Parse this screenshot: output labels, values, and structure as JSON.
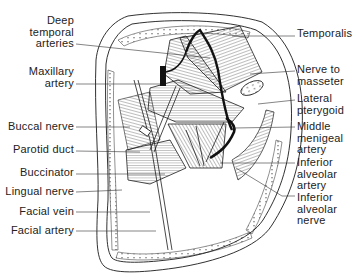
{
  "figure": {
    "colors": {
      "ink": "#1a1a1a",
      "background": "#ffffff"
    }
  },
  "labels": {
    "left": [
      {
        "id": "deep-temporal-arteries",
        "lines": [
          "Deep",
          "temporal",
          "arteries"
        ]
      },
      {
        "id": "maxillary-artery",
        "lines": [
          "Maxillary",
          "artery"
        ]
      },
      {
        "id": "buccal-nerve",
        "lines": [
          "Buccal nerve"
        ]
      },
      {
        "id": "parotid-duct",
        "lines": [
          "Parotid duct"
        ]
      },
      {
        "id": "buccinator",
        "lines": [
          "Buccinator"
        ]
      },
      {
        "id": "lingual-nerve",
        "lines": [
          "Lingual nerve"
        ]
      },
      {
        "id": "facial-vein",
        "lines": [
          "Facial vein"
        ]
      },
      {
        "id": "facial-artery",
        "lines": [
          "Facial artery"
        ]
      }
    ],
    "right": [
      {
        "id": "temporalis",
        "lines": [
          "Temporalis"
        ]
      },
      {
        "id": "nerve-to-masseter",
        "lines": [
          "Nerve to",
          "masseter"
        ]
      },
      {
        "id": "lateral-pterygoid",
        "lines": [
          "Lateral",
          "pterygoid"
        ]
      },
      {
        "id": "middle-menigeal-artery",
        "lines": [
          "Middle",
          "menigeal",
          "artery"
        ]
      },
      {
        "id": "inferior-alveolar-artery",
        "lines": [
          "Inferior",
          "alveolar",
          "artery"
        ]
      },
      {
        "id": "inferior-alveolar-nerve",
        "lines": [
          "Inferior",
          "alveolar",
          "nerve"
        ]
      }
    ]
  }
}
